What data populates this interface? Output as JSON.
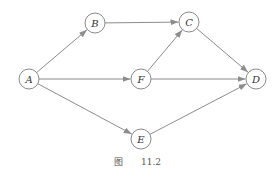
{
  "diagram": {
    "type": "directed-graph",
    "nodes": [
      {
        "id": "A",
        "label": "A",
        "x": 29,
        "y": 79
      },
      {
        "id": "B",
        "label": "B",
        "x": 95,
        "y": 23
      },
      {
        "id": "C",
        "label": "C",
        "x": 189,
        "y": 22
      },
      {
        "id": "D",
        "label": "D",
        "x": 256,
        "y": 79
      },
      {
        "id": "E",
        "label": "E",
        "x": 141,
        "y": 139
      },
      {
        "id": "F",
        "label": "F",
        "x": 141,
        "y": 79
      }
    ],
    "edges": [
      {
        "from": "A",
        "to": "B"
      },
      {
        "from": "A",
        "to": "F"
      },
      {
        "from": "A",
        "to": "E"
      },
      {
        "from": "B",
        "to": "C"
      },
      {
        "from": "F",
        "to": "C"
      },
      {
        "from": "F",
        "to": "D"
      },
      {
        "from": "C",
        "to": "D"
      },
      {
        "from": "E",
        "to": "D"
      }
    ],
    "caption": {
      "prefix": "图",
      "number": "11.2"
    },
    "colors": {
      "edge": "#8c8c8c",
      "node_stroke": "#8a8a8a",
      "label": "#333333"
    }
  }
}
